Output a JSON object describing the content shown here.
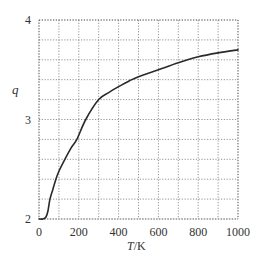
{
  "chart_data": {
    "type": "line",
    "title": "",
    "xlabel": "T/K",
    "ylabel": "q",
    "xlim": [
      0,
      1000
    ],
    "ylim": [
      2,
      4
    ],
    "grid": true,
    "grid_style": "dotted",
    "x_ticks": [
      0,
      200,
      400,
      600,
      800,
      1000
    ],
    "x_gridlines": [
      0,
      100,
      200,
      300,
      400,
      500,
      600,
      700,
      800,
      900,
      1000
    ],
    "y_ticks": [
      2,
      3,
      4
    ],
    "y_gridlines": [
      2.0,
      2.2,
      2.4,
      2.6,
      2.8,
      3.0,
      3.2,
      3.4,
      3.6,
      3.8,
      4.0
    ],
    "legend": null,
    "series": [
      {
        "name": "q",
        "color": "#2a2a2a",
        "x": [
          0,
          20,
          35,
          45,
          55,
          70,
          85,
          100,
          130,
          160,
          190,
          235,
          300,
          350,
          400,
          455,
          500,
          600,
          700,
          800,
          900,
          1000
        ],
        "y": [
          2.0,
          2.0,
          2.02,
          2.08,
          2.2,
          2.3,
          2.4,
          2.48,
          2.6,
          2.71,
          2.8,
          3.0,
          3.2,
          3.27,
          3.33,
          3.39,
          3.43,
          3.5,
          3.57,
          3.63,
          3.67,
          3.7
        ]
      }
    ]
  },
  "labels": {
    "x_axis": "T/K",
    "x_axis_italic": "T",
    "x_axis_unit": "/K",
    "y_axis": "q",
    "x_tick_labels": [
      "0",
      "200",
      "400",
      "600",
      "800",
      "1000"
    ],
    "y_tick_labels": [
      "2",
      "3",
      "4"
    ]
  }
}
